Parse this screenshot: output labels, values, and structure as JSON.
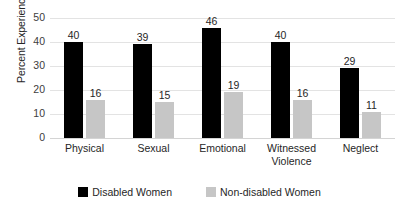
{
  "chart_data": {
    "type": "bar",
    "title": "",
    "xlabel": "",
    "ylabel": "Percent Experiencing Abusde",
    "ylim": [
      0,
      50
    ],
    "ytick_step": 10,
    "yticks": [
      50,
      40,
      30,
      20,
      10,
      0
    ],
    "grid": "horizontal",
    "legend_position": "bottom-center",
    "categories": [
      "Physical",
      "Sexual",
      "Emotional",
      "Witnessed Violence",
      "Neglect"
    ],
    "category_lines": [
      [
        "Physical"
      ],
      [
        "Sexual"
      ],
      [
        "Emotional"
      ],
      [
        "Witnessed",
        "Violence"
      ],
      [
        "Neglect"
      ]
    ],
    "series": [
      {
        "name": "Disabled Women",
        "color": "#000000",
        "values": [
          40,
          39,
          46,
          40,
          29
        ]
      },
      {
        "name": "Non-disabled Women",
        "color": "#C6C6C6",
        "values": [
          16,
          15,
          19,
          16,
          11
        ]
      }
    ],
    "data_labels": true
  },
  "legend": {
    "items": [
      {
        "label": "Disabled Women",
        "swatch": "black-square-swatch"
      },
      {
        "label": "Non-disabled Women",
        "swatch": "gray-square-swatch"
      }
    ]
  }
}
